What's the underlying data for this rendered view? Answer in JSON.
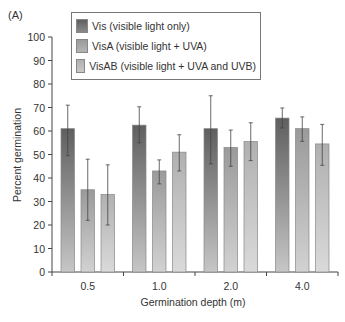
{
  "panel_label": "(A)",
  "chart_data": {
    "type": "bar",
    "title": "",
    "xlabel": "Germination depth (m)",
    "ylabel": "Percent germination",
    "ylim": [
      0,
      100
    ],
    "yticks": [
      0,
      10,
      20,
      30,
      40,
      50,
      60,
      70,
      80,
      90,
      100
    ],
    "grid": false,
    "legend_position": "top-left inside",
    "categories": [
      "0.5",
      "1.0",
      "2.0",
      "4.0"
    ],
    "series": [
      {
        "name": "Vis (visible light only)",
        "color": "#6e6e6e",
        "values": [
          61,
          62.5,
          61,
          65.5
        ],
        "error_low": [
          49.5,
          55,
          46,
          61.3
        ],
        "error_high": [
          71,
          70.3,
          75,
          69.8
        ]
      },
      {
        "name": "VisA (visible light + UVA)",
        "color": "#a4a4a4",
        "values": [
          35,
          43,
          53,
          61
        ],
        "error_low": [
          22,
          37.5,
          45,
          55.6
        ],
        "error_high": [
          48,
          47.7,
          60.4,
          66
        ]
      },
      {
        "name": "VisAB (visible light + UVA and UVB)",
        "color": "#b8b8b8",
        "values": [
          33,
          51,
          55.5,
          54.5
        ],
        "error_low": [
          20,
          43,
          47.4,
          45.4
        ],
        "error_high": [
          45.6,
          58.4,
          63.5,
          62.8
        ]
      }
    ]
  }
}
